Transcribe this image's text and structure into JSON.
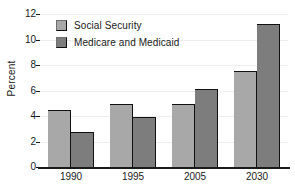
{
  "chart_data": {
    "type": "bar",
    "title": "",
    "xlabel": "",
    "ylabel": "Percent",
    "categories": [
      "1990",
      "1995",
      "2005",
      "2030"
    ],
    "series": [
      {
        "name": "Social Security",
        "color": "#a8a8a8",
        "values": [
          4.5,
          4.95,
          4.95,
          7.5
        ]
      },
      {
        "name": "Medicare and Medicaid",
        "color": "#7d7d7d",
        "values": [
          2.75,
          3.95,
          6.15,
          11.2
        ]
      }
    ],
    "ylim": [
      0,
      12
    ],
    "yticks": [
      0,
      2,
      4,
      6,
      8,
      10,
      12
    ],
    "ytick_labels": [
      "0",
      "2",
      "4",
      "6",
      "8",
      "10",
      "12"
    ],
    "grid": true,
    "legend_position": "top-left"
  }
}
